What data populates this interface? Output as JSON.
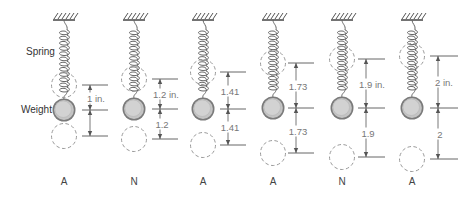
{
  "labels": {
    "spring": "Spring",
    "weight": "Weight"
  },
  "colors": {
    "ink": "#555555",
    "weight_fill": "#c4c4c4",
    "weight_ring": "#7a7a7a",
    "dashed": "#999999",
    "dim_text": "#777777"
  },
  "figures": [
    {
      "id": 1,
      "cx": 64,
      "upper_y": 85,
      "weight_y": 110,
      "lower_y": 136,
      "dim_x1": 82,
      "dim_x2": 108,
      "upper_dim": "1 in.",
      "lower_dim": "",
      "classification": "A"
    },
    {
      "id": 2,
      "cx": 134,
      "upper_y": 79,
      "weight_y": 109,
      "lower_y": 139,
      "dim_x1": 152,
      "dim_x2": 178,
      "upper_dim": "1.2 in.",
      "lower_dim": "1.2",
      "classification": "N"
    },
    {
      "id": 3,
      "cx": 203,
      "upper_y": 72,
      "weight_y": 109,
      "lower_y": 145,
      "dim_x1": 220,
      "dim_x2": 246,
      "upper_dim": "1.41",
      "lower_dim": "1.41",
      "classification": "A"
    },
    {
      "id": 4,
      "cx": 273,
      "upper_y": 63,
      "weight_y": 108,
      "lower_y": 153,
      "dim_x1": 288,
      "dim_x2": 314,
      "upper_dim": "1.73",
      "lower_dim": "1.73",
      "classification": "A"
    },
    {
      "id": 5,
      "cx": 342,
      "upper_y": 59,
      "weight_y": 108,
      "lower_y": 157,
      "dim_x1": 358,
      "dim_x2": 385,
      "upper_dim": "1.9 in.",
      "lower_dim": "1.9",
      "classification": "N"
    },
    {
      "id": 6,
      "cx": 412,
      "upper_y": 56,
      "weight_y": 108,
      "lower_y": 159,
      "dim_x1": 430,
      "dim_x2": 458,
      "upper_dim": "2 in.",
      "lower_dim": "2",
      "classification": "A"
    }
  ]
}
